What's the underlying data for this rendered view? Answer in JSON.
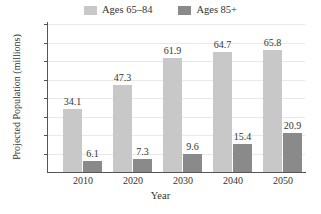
{
  "chart_data": {
    "type": "bar",
    "title": "",
    "xlabel": "Year",
    "ylabel": "Projected Population (millions)",
    "categories": [
      "2010",
      "2020",
      "2030",
      "2040",
      "2050"
    ],
    "series": [
      {
        "name": "Ages 65–84",
        "color": "#c8c8c8",
        "values": [
          34.1,
          47.3,
          61.9,
          64.7,
          65.8
        ]
      },
      {
        "name": "Ages 85+",
        "color": "#8a8a8a",
        "values": [
          6.1,
          7.3,
          9.6,
          15.4,
          20.9
        ]
      }
    ],
    "ylim": [
      0,
      80
    ],
    "yticks": [
      10,
      20,
      30,
      40,
      50,
      60,
      70,
      80
    ],
    "ytick_labels": [
      "10",
      "20",
      "30",
      "40",
      "50",
      "60",
      "70",
      "80"
    ],
    "grid": true,
    "legend_position": "top-center",
    "value_labels": {
      "series_0": [
        "34.1",
        "47.3",
        "61.9",
        "64.7",
        "65.8"
      ],
      "series_1": [
        "6.1",
        "7.3",
        "9.6",
        "15.4",
        "20.9"
      ]
    }
  },
  "legend": {
    "items": [
      {
        "label": "Ages 65–84",
        "color": "#c8c8c8"
      },
      {
        "label": "Ages 85+",
        "color": "#8a8a8a"
      }
    ]
  },
  "axes": {
    "y_title": "Projected Population (millions)",
    "x_title": "Year"
  }
}
